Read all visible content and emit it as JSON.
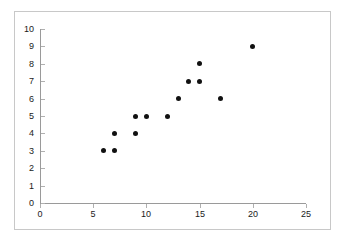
{
  "chart_data": {
    "type": "scatter",
    "title": "",
    "subtitle": "",
    "xlabel": "",
    "ylabel": "",
    "xlim": [
      0,
      25
    ],
    "ylim": [
      0,
      10
    ],
    "xticks": [
      0,
      5,
      10,
      15,
      20,
      25
    ],
    "yticks": [
      0,
      1,
      2,
      3,
      4,
      5,
      6,
      7,
      8,
      9,
      10
    ],
    "xtick_labels": [
      "0",
      "5",
      "10",
      "15",
      "20",
      "25"
    ],
    "ytick_labels": [
      "0",
      "1",
      "2",
      "3",
      "4",
      "5",
      "6",
      "7",
      "8",
      "9",
      "10"
    ],
    "grid": false,
    "legend": false,
    "legend_position": "none",
    "annotations": [],
    "marker": {
      "shape": "circle",
      "color": "#111111",
      "size": 5
    },
    "series": [
      {
        "name": "",
        "points": [
          {
            "x": 6,
            "y": 3
          },
          {
            "x": 7,
            "y": 3
          },
          {
            "x": 7,
            "y": 4
          },
          {
            "x": 9,
            "y": 4
          },
          {
            "x": 9,
            "y": 5
          },
          {
            "x": 10,
            "y": 5
          },
          {
            "x": 12,
            "y": 5
          },
          {
            "x": 13,
            "y": 6
          },
          {
            "x": 14,
            "y": 7
          },
          {
            "x": 15,
            "y": 7
          },
          {
            "x": 15,
            "y": 8
          },
          {
            "x": 17,
            "y": 6
          },
          {
            "x": 20,
            "y": 9
          }
        ]
      }
    ]
  },
  "style": {
    "frame_border_color": "#c8c8c8",
    "axis_color": "#9a9a9a",
    "tick_color": "#b0b0b0",
    "text_color": "#1a1a1a",
    "background": "#ffffff"
  }
}
